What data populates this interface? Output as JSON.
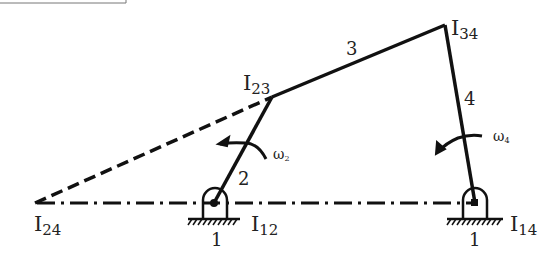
{
  "diagram": {
    "type": "four-bar linkage instantaneous centers",
    "colors": {
      "line": "#111111",
      "text": "#222222",
      "background": "#ffffff"
    },
    "points": {
      "I12": {
        "label_main": "I",
        "label_sub": "12",
        "x": 212,
        "y": 203
      },
      "I14": {
        "label_main": "I",
        "label_sub": "14",
        "x": 474,
        "y": 203
      },
      "I23": {
        "label_main": "I",
        "label_sub": "23",
        "x": 272,
        "y": 97
      },
      "I34": {
        "label_main": "I",
        "label_sub": "34",
        "x": 445,
        "y": 25
      },
      "I24": {
        "label_main": "I",
        "label_sub": "24",
        "x": 35,
        "y": 203
      }
    },
    "links": {
      "link2": "2",
      "link3": "3",
      "link4": "4",
      "ground_left": "1",
      "ground_right": "1"
    },
    "angular_velocities": {
      "omega2": {
        "symbol": "ω",
        "sub": "2"
      },
      "omega4": {
        "symbol": "ω",
        "sub": "4"
      }
    },
    "line_styles": {
      "ground_line": "dash-dot",
      "I24_to_I23": "dashed",
      "links": "solid"
    }
  }
}
